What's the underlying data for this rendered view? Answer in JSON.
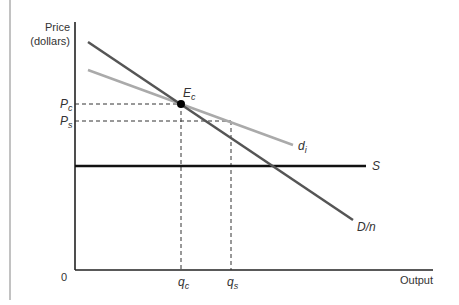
{
  "diagram": {
    "type": "economics-supply-demand",
    "y_axis_label_line1": "Price",
    "y_axis_label_line2": "(dollars)",
    "x_axis_label": "Output",
    "origin_label": "0",
    "price_labels": {
      "pc": {
        "main": "P",
        "sub": "c"
      },
      "ps": {
        "main": "P",
        "sub": "s"
      }
    },
    "quantity_labels": {
      "qc": {
        "main": "q",
        "sub": "c"
      },
      "qs": {
        "main": "q",
        "sub": "s"
      }
    },
    "equilibrium_label": {
      "main": "E",
      "sub": "c"
    },
    "curves": {
      "market_demand": {
        "main": "D/n",
        "color": "#555555"
      },
      "individual_demand": {
        "main": "d",
        "sub": "i",
        "color": "#aaaaaa"
      },
      "supply": {
        "main": "S",
        "color": "#111111"
      }
    }
  }
}
